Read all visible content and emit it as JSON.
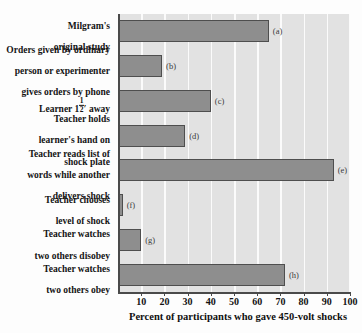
{
  "chart_data": {
    "type": "bar",
    "orientation": "horizontal",
    "title": "",
    "xlabel": "Percent of participants who gave 450-volt shocks",
    "ylabel": "",
    "xlim": [
      0,
      100
    ],
    "xticks": [
      10,
      20,
      30,
      40,
      50,
      60,
      70,
      80,
      90,
      100
    ],
    "grid": true,
    "legend": "none",
    "categories": [
      "Milgram's\noriginal study",
      "Orders given by ordinary\nperson or experimenter\ngives orders by phone",
      "Learner 1½′ away",
      "Teacher holds\nlearner's hand on\nshock plate",
      "Teacher reads list of\nwords while another\ndelivers shock",
      "Teacher chooses\nlevel of shock",
      "Teacher watches\ntwo others disobey",
      "Teacher watches\ntwo others obey"
    ],
    "point_labels": [
      "(a)",
      "(b)",
      "(c)",
      "(d)",
      "(e)",
      "(f)",
      "(g)",
      "(h)"
    ],
    "values": [
      65,
      19,
      40,
      29,
      93,
      2,
      10,
      72
    ],
    "colors": {
      "bar_fill": "#8e8e8e",
      "bar_edge": "#4e4e4e",
      "plot_background": "#e2e2e2",
      "gridline": "#fbfbfb",
      "axis": "#4a4a4a",
      "text": "#141414"
    }
  },
  "labels": {
    "cat0_line1": "Milgram's",
    "cat0_line2": "original study",
    "cat1_line1": "Orders given by ordinary",
    "cat1_line2": "person or experimenter",
    "cat1_line3": "gives orders by phone",
    "cat2_pre": "Learner 1",
    "cat2_num": "1",
    "cat2_den": "2",
    "cat2_post": "′ away",
    "cat3_line1": "Teacher holds",
    "cat3_line2": "learner's hand on",
    "cat3_line3": "shock plate",
    "cat4_line1": "Teacher reads list of",
    "cat4_line2": "words while another",
    "cat4_line3": "delivers shock",
    "cat5_line1": "Teacher chooses",
    "cat5_line2": "level of shock",
    "cat6_line1": "Teacher watches",
    "cat6_line2": "two others disobey",
    "cat7_line1": "Teacher watches",
    "cat7_line2": "two others obey"
  },
  "tags": {
    "a": "(a)",
    "b": "(b)",
    "c": "(c)",
    "d": "(d)",
    "e": "(e)",
    "f": "(f)",
    "g": "(g)",
    "h": "(h)"
  },
  "ticks": {
    "t10": "10",
    "t20": "20",
    "t30": "30",
    "t40": "40",
    "t50": "50",
    "t60": "60",
    "t70": "70",
    "t80": "80",
    "t90": "90",
    "t100": "100"
  },
  "axis_title": "Percent of participants who gave 450-volt shocks"
}
